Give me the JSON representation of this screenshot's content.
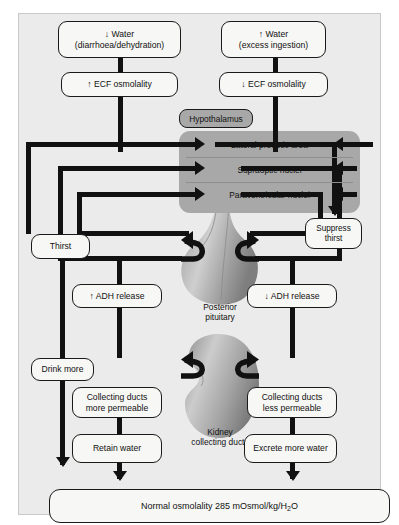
{
  "diagram": {
    "background_color": "#ebebeb",
    "box_fill": "#f7f7f5",
    "hypothalamus_fill": "#a8a8a8",
    "line_color": "#111111"
  },
  "left_pathway": {
    "stimulus_line1": "↓ Water",
    "stimulus_line2": "(diarrhoea/dehydration)",
    "osmolality": "↑ ECF osmolality",
    "thirst": "Thirst",
    "adh": "↑ ADH release",
    "drink": "Drink more",
    "ducts_line1": "Collecting ducts",
    "ducts_line2": "more permeable",
    "outcome": "Retain water"
  },
  "right_pathway": {
    "stimulus_line1": "↑ Water",
    "stimulus_line2": "(excess ingestion)",
    "osmolality": "↓ ECF osmolality",
    "thirst_line1": "Suppress",
    "thirst_line2": "thirst",
    "adh": "↓ ADH release",
    "ducts_line1": "Collecting ducts",
    "ducts_line2": "less permeable",
    "outcome": "Excrete more water"
  },
  "hypothalamus": {
    "label": "Hypothalamus",
    "nuclei": [
      "Lateral preoptic area",
      "Supraoptic nuclei",
      "Paraventricular nuclei"
    ]
  },
  "organs": {
    "pituitary_line1": "Posterior",
    "pituitary_line2": "pituitary",
    "kidney_line1": "Kidney",
    "kidney_line2": "collecting ducts"
  },
  "result": {
    "text_before": "Normal osmolality 285 mOsmol/kg/H",
    "subscript": "2",
    "text_after": "O"
  }
}
